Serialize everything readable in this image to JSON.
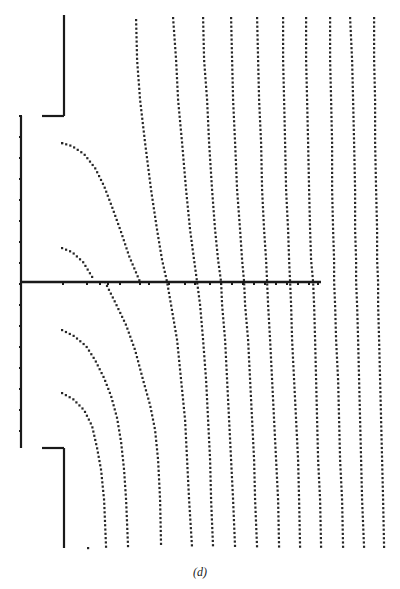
{
  "caption": "(d)",
  "colors": {
    "line": "#1a1a1a",
    "dot": "#262626",
    "background": "#ffffff"
  },
  "walls": {
    "upper_vertical": {
      "x": 64,
      "y1": 15,
      "y2": 116
    },
    "upper_horizontal": {
      "y": 116,
      "x1": 42,
      "x2": 64
    },
    "lower_horizontal": {
      "y": 448,
      "x1": 42,
      "x2": 64
    },
    "lower_vertical": {
      "x": 64,
      "y1": 448,
      "y2": 548
    },
    "left_boundary": {
      "x": 21,
      "y1": 116,
      "y2": 448,
      "tick_spacing": 21
    },
    "center_plate": {
      "y": 282,
      "x1": 21,
      "x2": 321,
      "ticks": [
        63,
        87,
        100,
        108,
        120,
        140,
        149,
        169,
        185,
        195,
        210,
        221,
        232,
        243,
        254,
        265,
        276,
        287,
        298,
        309,
        318
      ]
    }
  },
  "curves": {
    "sample_y": [
      18,
      60,
      100,
      143,
      190,
      230,
      260,
      282,
      305,
      340,
      380,
      420,
      460,
      500,
      548
    ],
    "lines": [
      {
        "id": "c1-upper",
        "points": [
          [
            62,
            143
          ],
          [
            72,
            146
          ],
          [
            84,
            154
          ],
          [
            95,
            168
          ],
          [
            104,
            186
          ],
          [
            112,
            207
          ],
          [
            121,
            232
          ],
          [
            129,
            256
          ],
          [
            140,
            282
          ]
        ]
      },
      {
        "id": "c2-upper",
        "points": [
          [
            62,
            248
          ],
          [
            72,
            252
          ],
          [
            83,
            262
          ],
          [
            94,
            280
          ]
        ]
      },
      {
        "id": "c1-lower",
        "points": [
          [
            105,
            282
          ],
          [
            114,
            300
          ],
          [
            126,
            325
          ],
          [
            135,
            350
          ],
          [
            143,
            380
          ],
          [
            150,
            405
          ],
          [
            155,
            430
          ],
          [
            158,
            460
          ],
          [
            160,
            500
          ],
          [
            161,
            548
          ]
        ]
      },
      {
        "id": "c2-lower",
        "points": [
          [
            62,
            330
          ],
          [
            74,
            336
          ],
          [
            86,
            346
          ],
          [
            95,
            360
          ],
          [
            104,
            378
          ],
          [
            111,
            396
          ],
          [
            117,
            418
          ],
          [
            121,
            442
          ],
          [
            124,
            470
          ],
          [
            126,
            500
          ],
          [
            128,
            548
          ]
        ]
      },
      {
        "id": "c3-lower",
        "points": [
          [
            62,
            393
          ],
          [
            73,
            399
          ],
          [
            84,
            410
          ],
          [
            92,
            426
          ],
          [
            97,
            448
          ],
          [
            101,
            470
          ],
          [
            104,
            500
          ],
          [
            106,
            548
          ]
        ]
      },
      {
        "id": "c3-upper",
        "points": [
          [
            62,
            143
          ],
          [
            62,
            143
          ]
        ]
      },
      {
        "id": "s1",
        "points": [
          [
            136,
            20
          ],
          [
            137,
            60
          ],
          [
            140,
            100
          ],
          [
            145,
            143
          ],
          [
            151,
            190
          ],
          [
            157,
            230
          ],
          [
            162,
            260
          ],
          [
            167,
            282
          ],
          [
            171,
            305
          ],
          [
            177,
            340
          ],
          [
            181,
            380
          ],
          [
            185,
            420
          ],
          [
            187,
            460
          ],
          [
            189,
            500
          ],
          [
            192,
            548
          ]
        ]
      },
      {
        "id": "s2",
        "points": [
          [
            173,
            18
          ],
          [
            176,
            60
          ],
          [
            178,
            100
          ],
          [
            182,
            143
          ],
          [
            186,
            190
          ],
          [
            190,
            230
          ],
          [
            194,
            260
          ],
          [
            197,
            282
          ],
          [
            200,
            305
          ],
          [
            203,
            340
          ],
          [
            206,
            380
          ],
          [
            208,
            420
          ],
          [
            210,
            460
          ],
          [
            211,
            500
          ],
          [
            213,
            548
          ]
        ]
      },
      {
        "id": "s3",
        "points": [
          [
            203,
            18
          ],
          [
            204,
            60
          ],
          [
            207,
            100
          ],
          [
            209,
            143
          ],
          [
            212,
            190
          ],
          [
            215,
            230
          ],
          [
            218,
            260
          ],
          [
            221,
            282
          ],
          [
            222,
            305
          ],
          [
            225,
            340
          ],
          [
            227,
            380
          ],
          [
            229,
            420
          ],
          [
            231,
            460
          ],
          [
            233,
            500
          ],
          [
            235,
            548
          ]
        ]
      },
      {
        "id": "s4",
        "points": [
          [
            231,
            18
          ],
          [
            232,
            60
          ],
          [
            233,
            100
          ],
          [
            235,
            143
          ],
          [
            237,
            190
          ],
          [
            240,
            230
          ],
          [
            242,
            260
          ],
          [
            244,
            282
          ],
          [
            245,
            305
          ],
          [
            248,
            340
          ],
          [
            250,
            380
          ],
          [
            252,
            420
          ],
          [
            254,
            460
          ],
          [
            255,
            500
          ],
          [
            257,
            548
          ]
        ]
      },
      {
        "id": "s5",
        "points": [
          [
            257,
            18
          ],
          [
            258,
            60
          ],
          [
            259,
            100
          ],
          [
            261,
            143
          ],
          [
            262,
            190
          ],
          [
            264,
            230
          ],
          [
            266,
            260
          ],
          [
            267,
            282
          ],
          [
            268,
            305
          ],
          [
            270,
            340
          ],
          [
            272,
            380
          ],
          [
            274,
            420
          ],
          [
            276,
            460
          ],
          [
            278,
            500
          ],
          [
            279,
            548
          ]
        ]
      },
      {
        "id": "s6",
        "points": [
          [
            283,
            18
          ],
          [
            283,
            60
          ],
          [
            284,
            100
          ],
          [
            285,
            143
          ],
          [
            286,
            190
          ],
          [
            288,
            230
          ],
          [
            289,
            260
          ],
          [
            290,
            282
          ],
          [
            291,
            305
          ],
          [
            292,
            340
          ],
          [
            294,
            380
          ],
          [
            296,
            420
          ],
          [
            298,
            460
          ],
          [
            299,
            500
          ],
          [
            300,
            548
          ]
        ]
      },
      {
        "id": "s7",
        "points": [
          [
            306,
            18
          ],
          [
            306,
            60
          ],
          [
            307,
            100
          ],
          [
            308,
            143
          ],
          [
            309,
            190
          ],
          [
            310,
            230
          ],
          [
            311,
            260
          ],
          [
            313,
            282
          ],
          [
            314,
            305
          ],
          [
            315,
            340
          ],
          [
            316,
            380
          ],
          [
            317,
            420
          ],
          [
            318,
            460
          ],
          [
            320,
            500
          ],
          [
            321,
            548
          ]
        ]
      },
      {
        "id": "s8",
        "points": [
          [
            330,
            18
          ],
          [
            330,
            60
          ],
          [
            331,
            100
          ],
          [
            332,
            143
          ],
          [
            332,
            190
          ],
          [
            333,
            230
          ],
          [
            334,
            260
          ],
          [
            334,
            282
          ],
          [
            335,
            305
          ],
          [
            336,
            340
          ],
          [
            338,
            380
          ],
          [
            339,
            420
          ],
          [
            340,
            460
          ],
          [
            342,
            500
          ],
          [
            343,
            548
          ]
        ]
      },
      {
        "id": "s9",
        "points": [
          [
            350,
            18
          ],
          [
            352,
            60
          ],
          [
            353,
            100
          ],
          [
            354,
            143
          ],
          [
            355,
            190
          ],
          [
            355,
            230
          ],
          [
            356,
            260
          ],
          [
            356,
            282
          ],
          [
            357,
            305
          ],
          [
            358,
            340
          ],
          [
            359,
            380
          ],
          [
            360,
            420
          ],
          [
            361,
            460
          ],
          [
            362,
            500
          ],
          [
            364,
            548
          ]
        ]
      },
      {
        "id": "s10",
        "points": [
          [
            374,
            18
          ],
          [
            374,
            60
          ],
          [
            375,
            100
          ],
          [
            375,
            143
          ],
          [
            376,
            190
          ],
          [
            377,
            230
          ],
          [
            377,
            260
          ],
          [
            378,
            282
          ],
          [
            378,
            305
          ],
          [
            379,
            340
          ],
          [
            380,
            380
          ],
          [
            381,
            420
          ],
          [
            382,
            460
          ],
          [
            383,
            500
          ],
          [
            384,
            548
          ]
        ]
      }
    ],
    "lone_dot": [
      88,
      548
    ]
  }
}
